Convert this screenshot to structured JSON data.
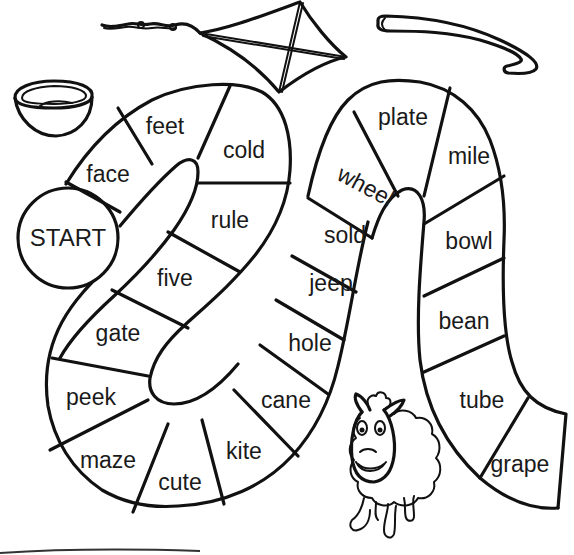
{
  "worksheet": {
    "type": "long-vowel board game",
    "start_label": "START",
    "spaces": [
      {
        "index": 0,
        "word": "START"
      },
      {
        "index": 1,
        "word": "face"
      },
      {
        "index": 2,
        "word": "feet"
      },
      {
        "index": 3,
        "word": "cold"
      },
      {
        "index": 4,
        "word": "rule"
      },
      {
        "index": 5,
        "word": "five"
      },
      {
        "index": 6,
        "word": "gate"
      },
      {
        "index": 7,
        "word": "peek"
      },
      {
        "index": 8,
        "word": "maze"
      },
      {
        "index": 9,
        "word": "cute"
      },
      {
        "index": 10,
        "word": "kite"
      },
      {
        "index": 11,
        "word": "cane"
      },
      {
        "index": 12,
        "word": "hole"
      },
      {
        "index": 13,
        "word": "jeep"
      },
      {
        "index": 14,
        "word": "sold"
      },
      {
        "index": 15,
        "word": "wheel"
      },
      {
        "index": 16,
        "word": "plate"
      },
      {
        "index": 17,
        "word": "mile"
      },
      {
        "index": 18,
        "word": "bowl"
      },
      {
        "index": 19,
        "word": "bean"
      },
      {
        "index": 20,
        "word": "tube"
      },
      {
        "index": 21,
        "word": "grape"
      }
    ],
    "illustrations": [
      {
        "name": "bowl-picture",
        "depicts": "bowl"
      },
      {
        "name": "kite-picture",
        "depicts": "kite"
      },
      {
        "name": "cane-picture",
        "depicts": "cane"
      },
      {
        "name": "sheep-picture",
        "depicts": "sheep"
      }
    ],
    "colors": {
      "ink": "#111111",
      "paper": "#ffffff"
    }
  }
}
